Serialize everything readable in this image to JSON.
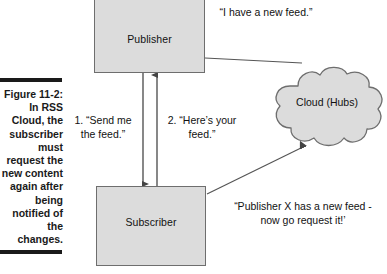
{
  "figure": {
    "caption_label": "Figure 11-2:",
    "caption_body": "In RSS Cloud, the subscriber must request the new content again after being notified of the changes.",
    "caption_full": "Figure 11-2: In RSS Cloud, the subscriber must request the new content again after being notified of the changes."
  },
  "nodes": {
    "publisher": {
      "label": "Publisher"
    },
    "subscriber": {
      "label": "Subscriber"
    },
    "cloud": {
      "label": "Cloud (Hubs)"
    }
  },
  "labels": {
    "step1": "1. “Send me the feed.”",
    "step2": "2. “Here’s your feed.”",
    "publisher_announce": "“I have a new feed.”",
    "cloud_notify": "“Publisher X has a new feed -  now go request it!’"
  },
  "connectors": [
    {
      "name": "subscriber-to-publisher-request",
      "from": "Subscriber",
      "to": "Publisher",
      "direction": "up",
      "step": "1"
    },
    {
      "name": "publisher-to-subscriber-feed",
      "from": "Publisher",
      "to": "Subscriber",
      "direction": "down",
      "step": "2"
    },
    {
      "name": "publisher-to-cloud",
      "from": "Publisher",
      "to": "Cloud (Hubs)",
      "direction": "none"
    },
    {
      "name": "subscriber-to-cloud",
      "from": "Subscriber",
      "to": "Cloud (Hubs)",
      "direction": "up-right"
    }
  ],
  "colors": {
    "box_fill": "#dcdcdc",
    "box_stroke": "#6e6e6e",
    "cloud_fill": "#dcdcdc",
    "cloud_stroke": "#6e6e6e",
    "line": "#555555",
    "text": "#111111",
    "rule": "#1a1a1a",
    "background": "#ffffff"
  }
}
